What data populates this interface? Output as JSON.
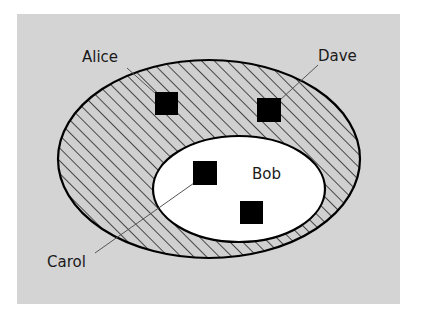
{
  "diagram": {
    "type": "nested-set-venn",
    "colors": {
      "background_panel": "#d4d4d4",
      "page": "#ffffff",
      "outer_set_hatch_bg": "#d0d0d0",
      "hatch_line": "#222222",
      "outer_set_stroke": "#000000",
      "inner_set_fill": "#ffffff",
      "inner_set_stroke": "#000000",
      "element_fill": "#000000",
      "leader_line": "#555555",
      "label_text": "#1a1a1a"
    },
    "sets": [
      {
        "id": "outer",
        "fill": "diagonal-hatch",
        "shape": "ellipse",
        "cx": 209,
        "cy": 159,
        "rx": 151,
        "ry": 99
      },
      {
        "id": "inner",
        "label": "Bob",
        "fill": "white",
        "shape": "ellipse",
        "cx": 239,
        "cy": 189,
        "rx": 86,
        "ry": 53
      }
    ],
    "labels": {
      "alice": "Alice",
      "dave": "Dave",
      "bob": "Bob",
      "carol": "Carol"
    },
    "elements": [
      {
        "id": "alice-square",
        "label": "Alice",
        "set": "outer",
        "x": 155,
        "y": 92,
        "size": 23
      },
      {
        "id": "dave-square",
        "label": "Dave",
        "set": "outer",
        "x": 257,
        "y": 98,
        "size": 24
      },
      {
        "id": "carol-square",
        "label": "Carol",
        "set": "inner",
        "x": 193,
        "y": 161,
        "size": 24
      },
      {
        "id": "unlabeled-square",
        "label": "",
        "set": "inner",
        "x": 240,
        "y": 201,
        "size": 23
      }
    ]
  }
}
